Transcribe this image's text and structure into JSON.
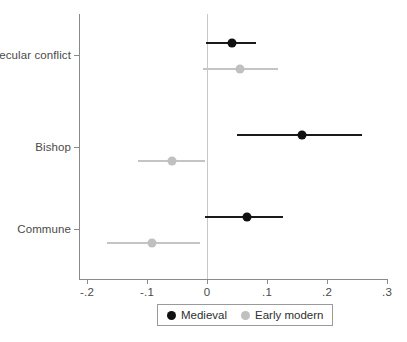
{
  "chart_data": {
    "type": "scatter",
    "title": "",
    "subtitle": "",
    "xlabel": "",
    "ylabel": "",
    "xlim": [
      -0.22,
      0.31
    ],
    "ylim": [
      0,
      3
    ],
    "grid": false,
    "zero_reference_line": 0,
    "legend_position": "bottom",
    "orientation": "horizontal",
    "categories": [
      "Secular conflict",
      "Bishop",
      "Commune"
    ],
    "x_ticks": [
      -0.2,
      -0.1,
      0,
      0.1,
      0.2,
      0.3
    ],
    "x_tick_labels": [
      "-.2",
      "-.1",
      "0",
      ".1",
      ".2",
      ".3"
    ],
    "series": [
      {
        "name": "Medieval",
        "color": "#111111",
        "points": [
          {
            "category": "Secular conflict",
            "estimate": 0.042,
            "ci_low": -0.002,
            "ci_high": 0.082
          },
          {
            "category": "Bishop",
            "estimate": 0.158,
            "ci_low": 0.05,
            "ci_high": 0.258
          },
          {
            "category": "Commune",
            "estimate": 0.067,
            "ci_low": -0.003,
            "ci_high": 0.127
          }
        ]
      },
      {
        "name": "Early modern",
        "color": "#c0c0c0",
        "points": [
          {
            "category": "Secular conflict",
            "estimate": 0.055,
            "ci_low": -0.007,
            "ci_high": 0.118
          },
          {
            "category": "Bishop",
            "estimate": -0.058,
            "ci_low": -0.115,
            "ci_high": -0.003
          },
          {
            "category": "Commune",
            "estimate": -0.092,
            "ci_low": -0.167,
            "ci_high": -0.012
          }
        ]
      }
    ]
  },
  "legend": {
    "entries": [
      {
        "label": "Medieval",
        "color": "#111111"
      },
      {
        "label": "Early modern",
        "color": "#c0c0c0"
      }
    ]
  },
  "axis": {
    "x_tick_labels": [
      "-.2",
      "-.1",
      "0",
      ".1",
      ".2",
      ".3"
    ],
    "y_tick_labels": [
      "Secular conflict",
      "Bishop",
      "Commune"
    ]
  }
}
